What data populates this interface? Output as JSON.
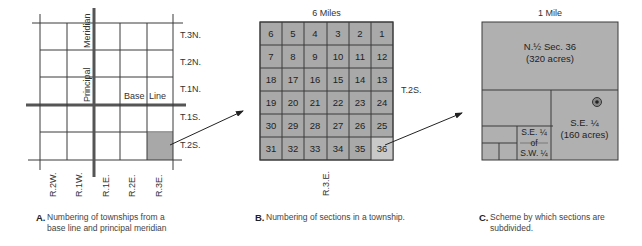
{
  "panel_a": {
    "townships": [
      "T.3N.",
      "T.2N.",
      "T.1N.",
      "T.1S.",
      "T.2S."
    ],
    "ranges": [
      "R.2W.",
      "R.1W.",
      "R.1E.",
      "R.2E.",
      "R.3E."
    ],
    "meridian_label_1": "Principal",
    "meridian_label_2": "Meridian",
    "baseline_label_1": "Base",
    "baseline_label_2": "Line",
    "highlighted_cell": "T.2S. R.3E.",
    "caption_letter": "A.",
    "caption_text": "Numbering of townships from a base line and principal meridian"
  },
  "panel_b": {
    "title": "6 Miles",
    "township_label": "T.2S.",
    "range_label": "R.3.E.",
    "sections": [
      [
        "6",
        "5",
        "4",
        "3",
        "2",
        "1"
      ],
      [
        "7",
        "8",
        "9",
        "10",
        "11",
        "12"
      ],
      [
        "18",
        "17",
        "16",
        "15",
        "14",
        "13"
      ],
      [
        "19",
        "20",
        "21",
        "22",
        "23",
        "24"
      ],
      [
        "30",
        "29",
        "28",
        "27",
        "26",
        "25"
      ],
      [
        "31",
        "32",
        "33",
        "34",
        "35",
        "36"
      ]
    ],
    "highlighted_section": "36",
    "caption_letter": "B.",
    "caption_text": "Numbering of sections in a township."
  },
  "panel_c": {
    "title": "1 Mile",
    "north_half_line1": "N.½ Sec. 36",
    "north_half_line2": "(320 acres)",
    "se_quarter_line1": "S.E. ¼",
    "se_quarter_line2": "(160 acres)",
    "se_of_sw_line1": "S.E. ¼",
    "se_of_sw_line2": "of",
    "se_of_sw_line3": "S.W. ¼",
    "caption_letter": "C.",
    "caption_text": "Scheme by which sections are subdivided."
  },
  "colors": {
    "grid_line": "#3a3a3a",
    "section_fill": "#a9a9a9",
    "highlight_fill": "#c9c9c9",
    "township_highlight": "#a8a8a8",
    "subdivision_fill": "#b0b0b0"
  }
}
